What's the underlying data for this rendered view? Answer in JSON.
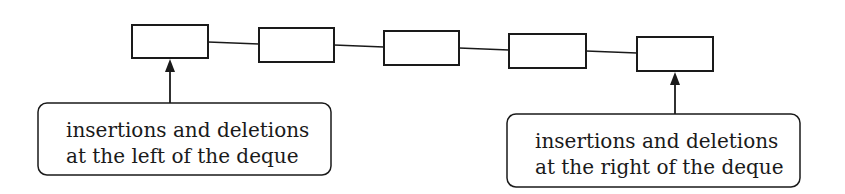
{
  "diagram": {
    "title": "",
    "nodes": [
      {
        "id": "node-1",
        "x": 132,
        "y": 25,
        "w": 76,
        "h": 33
      },
      {
        "id": "node-2",
        "x": 259,
        "y": 28,
        "w": 75,
        "h": 34
      },
      {
        "id": "node-3",
        "x": 384,
        "y": 31,
        "w": 75,
        "h": 34
      },
      {
        "id": "node-4",
        "x": 509,
        "y": 34,
        "w": 77,
        "h": 34
      },
      {
        "id": "node-5",
        "x": 637,
        "y": 37,
        "w": 76,
        "h": 34
      }
    ],
    "callouts": {
      "left": {
        "line1": "insertions and deletions",
        "line2": "at the left of the deque"
      },
      "right": {
        "line1": "insertions and deletions",
        "line2": "at the right of the deque"
      }
    },
    "colors": {
      "stroke": "#1a1a1a",
      "background": "#ffffff"
    }
  }
}
